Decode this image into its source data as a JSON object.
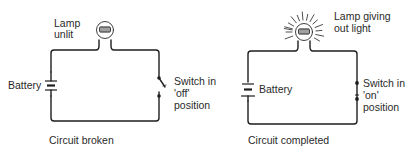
{
  "diagrams": [
    {
      "id": "broken",
      "lamp_label": [
        "Lamp",
        "unlit"
      ],
      "battery_label": "Battery",
      "switch_label": [
        "Switch in",
        "'off'",
        "position"
      ],
      "caption": "Circuit broken",
      "lamp_state": "unlit",
      "switch_state": "off"
    },
    {
      "id": "completed",
      "lamp_label": [
        "Lamp giving",
        "out light"
      ],
      "battery_label": "Battery",
      "switch_label": [
        "Switch in",
        "'on'",
        "position"
      ],
      "caption": "Circuit completed",
      "lamp_state": "lit",
      "switch_state": "on"
    }
  ]
}
